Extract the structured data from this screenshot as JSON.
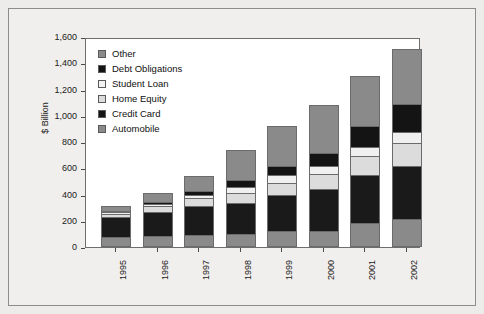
{
  "chart_data": {
    "type": "bar",
    "subtype": "stacked-bar",
    "title": "",
    "xlabel": "",
    "ylabel": "$ Billion",
    "ylim": [
      0,
      1600
    ],
    "ytick_step": 200,
    "ytick_labels": [
      "1,600",
      "1,400",
      "1,200",
      "1,000",
      "800",
      "600",
      "400",
      "200",
      "0"
    ],
    "ytick_values": [
      1600,
      1400,
      1200,
      1000,
      800,
      600,
      400,
      200,
      0
    ],
    "grid": false,
    "legend_position": "top-left-inside",
    "categories": [
      "1995",
      "1996",
      "1997",
      "1998",
      "1999",
      "2000",
      "2001",
      "2002"
    ],
    "series": [
      {
        "name": "Automobile",
        "color": "#8a8a8a",
        "values": [
          75,
          85,
          95,
          100,
          120,
          125,
          180,
          215
        ]
      },
      {
        "name": "Credit Card",
        "color": "#1a1a1a",
        "values": [
          155,
          185,
          215,
          235,
          275,
          320,
          370,
          400
        ]
      },
      {
        "name": "Home Equity",
        "color": "#dcdcdc",
        "values": [
          25,
          40,
          60,
          80,
          95,
          110,
          140,
          180
        ]
      },
      {
        "name": "Student Loan",
        "color": "#f0f0f0",
        "values": [
          10,
          15,
          25,
          40,
          55,
          65,
          75,
          85
        ]
      },
      {
        "name": "Debt Obligations",
        "color": "#141414",
        "values": [
          10,
          20,
          35,
          55,
          75,
          100,
          160,
          210
        ]
      },
      {
        "name": "Other",
        "color": "#8a8a8a",
        "values": [
          35,
          65,
          110,
          230,
          300,
          360,
          375,
          415
        ]
      }
    ],
    "totals": [
      310,
      410,
      540,
      740,
      920,
      1080,
      1300,
      1505
    ],
    "stack_order_bottom_to_top": [
      "Automobile",
      "Credit Card",
      "Home Equity",
      "Student Loan",
      "Debt Obligations",
      "Other"
    ]
  },
  "legend": {
    "items": [
      {
        "label": "Other",
        "swatch": "gray"
      },
      {
        "label": "Debt Obligations",
        "swatch": "black"
      },
      {
        "label": "Student Loan",
        "swatch": "white"
      },
      {
        "label": "Home Equity",
        "swatch": "light"
      },
      {
        "label": "Credit Card",
        "swatch": "black"
      },
      {
        "label": "Automobile",
        "swatch": "gray"
      }
    ]
  },
  "colors": {
    "gray": "#8a8a8a",
    "black": "#141414",
    "light": "#dcdcdc",
    "white": "#f2f2f2",
    "plot_bg": "#ffffff",
    "page_bg": "#eeecea",
    "axis": "#4a4a4a"
  }
}
